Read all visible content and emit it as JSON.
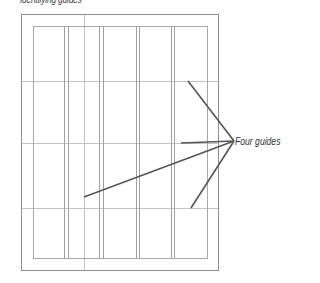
{
  "title": "Identifying guides",
  "callout": {
    "label": "Four guides",
    "anchor": {
      "x": 234,
      "y": 141
    }
  },
  "page": {
    "outer": {
      "x": 21,
      "y": 14,
      "w": 197,
      "h": 256
    },
    "margin": {
      "x": 33,
      "y": 26,
      "w": 174,
      "h": 232
    }
  },
  "column_guides_x": [
    64,
    68,
    99,
    103,
    136,
    139,
    171,
    174
  ],
  "vertical_ruler_guide_x": 84,
  "horizontal_guides_y": [
    81,
    143,
    208
  ],
  "leaders": [
    {
      "x1": 188,
      "y1": 81,
      "x2": 234,
      "y2": 141
    },
    {
      "x1": 181,
      "y1": 143,
      "x2": 234,
      "y2": 141
    },
    {
      "x1": 84,
      "y1": 197,
      "x2": 234,
      "y2": 141
    },
    {
      "x1": 191,
      "y1": 208,
      "x2": 234,
      "y2": 141
    }
  ],
  "colors": {
    "page_border": "#8f8f8f",
    "margin_line": "#a8a8a8",
    "column_line": "#a0a0a0",
    "guide_line": "#c4c4c4",
    "leader_line": "#555555",
    "text": "#333333"
  }
}
